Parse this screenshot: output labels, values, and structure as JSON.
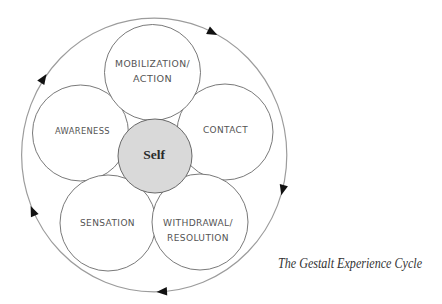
{
  "diagram": {
    "title": "The Gestalt Experience Cycle",
    "center": {
      "label": "Self"
    },
    "cycle_direction": "clockwise",
    "stages": {
      "sensation": {
        "line1": "SENSATION"
      },
      "awareness": {
        "line1": "AWARENESS"
      },
      "mobilization": {
        "line1": "MOBILIZATION/",
        "line2": "ACTION"
      },
      "contact": {
        "line1": "CONTACT"
      },
      "withdrawal": {
        "line1": "WITHDRAWAL/",
        "line2": "RESOLUTION"
      }
    },
    "stage_order": [
      "SENSATION",
      "AWARENESS",
      "MOBILIZATION/ACTION",
      "CONTACT",
      "WITHDRAWAL/RESOLUTION"
    ],
    "arrow_count": 5,
    "colors": {
      "ring": "#9c9c9c",
      "stage_outline": "#6a6a6a",
      "self_fill": "#d9d9d9",
      "arrow": "#111111",
      "label_text": "#545454",
      "caption_text": "#333333"
    }
  }
}
